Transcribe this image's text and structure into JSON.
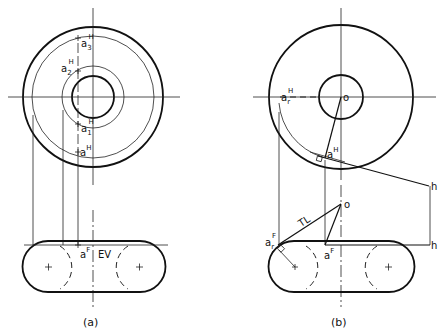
{
  "figure": {
    "panels": [
      {
        "caption": "(a)",
        "points": {
          "a3": {
            "base": "a",
            "sub": "3",
            "sup": "H"
          },
          "a2": {
            "base": "a",
            "sub": "2",
            "sup": "H"
          },
          "a1": {
            "base": "a",
            "sub": "1",
            "sup": "H"
          },
          "a": {
            "base": "a",
            "sup": "H"
          },
          "aF": {
            "base": "a",
            "sup": "F"
          }
        },
        "annotation": "EV"
      },
      {
        "caption": "(b)",
        "points": {
          "o_top": "o",
          "arH": {
            "base": "a",
            "sub": "r",
            "sup": "H"
          },
          "aH": {
            "base": "a",
            "sup": "H"
          },
          "h_top": "h",
          "o_front": "o",
          "arF": {
            "base": "a",
            "sub": "r",
            "sup": "F"
          },
          "aF": {
            "base": "a",
            "sup": "F"
          },
          "h_front": "h"
        },
        "annotation": "TL"
      }
    ]
  }
}
